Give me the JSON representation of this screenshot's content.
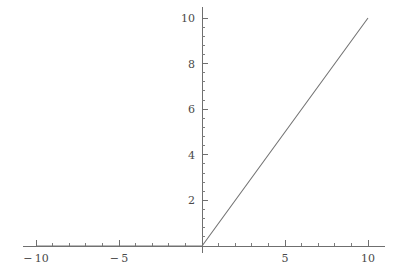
{
  "chart_data": {
    "type": "line",
    "title": "",
    "subtitle": "",
    "xlabel": "",
    "ylabel": "",
    "grid": false,
    "legend": null,
    "legend_position": "none",
    "function": "max(x, 0)",
    "xlim": [
      -10.8,
      11.0
    ],
    "ylim": [
      0,
      10.5
    ],
    "x_major_ticks": [
      -10,
      -5,
      5,
      10
    ],
    "x_major_tick_labels": [
      "-10",
      "-5",
      "5",
      "10"
    ],
    "x_minor_tick_step": 1,
    "x_minor_ticks": [
      -9,
      -8,
      -7,
      -6,
      -4,
      -3,
      -2,
      -1,
      1,
      2,
      3,
      4,
      6,
      7,
      8,
      9
    ],
    "y_major_ticks": [
      2,
      4,
      6,
      8,
      10
    ],
    "y_major_tick_labels": [
      "2",
      "4",
      "6",
      "8",
      "10"
    ],
    "y_minor_tick_step": 0.4,
    "y_minor_ticks": [
      0.4,
      0.8,
      1.2,
      1.6,
      2.4,
      2.8,
      3.2,
      3.6,
      4.4,
      4.8,
      5.2,
      5.6,
      6.4,
      6.8,
      7.2,
      7.6,
      8.4,
      8.8,
      9.2,
      9.6
    ],
    "x": [
      -10,
      -9,
      -8,
      -7,
      -6,
      -5,
      -4,
      -3,
      -2,
      -1,
      0,
      1,
      2,
      3,
      4,
      5,
      6,
      7,
      8,
      9,
      10
    ],
    "y": [
      0,
      0,
      0,
      0,
      0,
      0,
      0,
      0,
      0,
      0,
      0,
      1,
      2,
      3,
      4,
      5,
      6,
      7,
      8,
      9,
      10
    ],
    "series": [
      {
        "name": "max(x, 0)",
        "x": [
          -10,
          0,
          10
        ],
        "values": [
          0,
          0,
          10
        ],
        "color": "#757575"
      }
    ],
    "axis_color": "#6f6f6f",
    "line_color": "#757575",
    "background_color": "#ffffff",
    "tick_label_color": "#4a4a4a"
  }
}
